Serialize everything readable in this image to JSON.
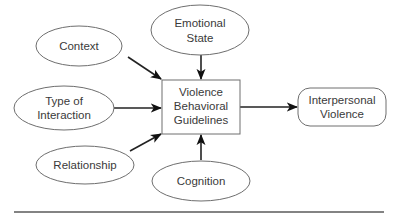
{
  "diagram": {
    "center": {
      "id": "vbg",
      "lines": [
        "Violence",
        "Behavioral",
        "Guidelines"
      ]
    },
    "inputs": [
      {
        "id": "context",
        "lines": [
          "Context"
        ]
      },
      {
        "id": "emotional-state",
        "lines": [
          "Emotional",
          "State"
        ]
      },
      {
        "id": "type-of-interaction",
        "lines": [
          "Type of",
          "Interaction"
        ]
      },
      {
        "id": "relationship",
        "lines": [
          "Relationship"
        ]
      },
      {
        "id": "cognition",
        "lines": [
          "Cognition"
        ]
      }
    ],
    "output": {
      "id": "interpersonal-violence",
      "lines": [
        "Interpersonal",
        "Violence"
      ]
    },
    "edges": [
      {
        "from": "context",
        "to": "vbg"
      },
      {
        "from": "emotional-state",
        "to": "vbg"
      },
      {
        "from": "type-of-interaction",
        "to": "vbg"
      },
      {
        "from": "relationship",
        "to": "vbg"
      },
      {
        "from": "cognition",
        "to": "vbg"
      },
      {
        "from": "vbg",
        "to": "interpersonal-violence"
      }
    ]
  }
}
